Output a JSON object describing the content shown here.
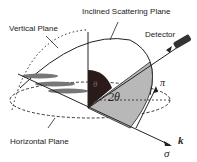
{
  "labels": {
    "inclined_plane": "Inclined Scattering Plane",
    "vertical_plane": "Vertical Plane",
    "detector": "Detector",
    "horizontal_plane": "Horizontal Plane"
  },
  "symbols": {
    "theta": "θ",
    "two_theta": "2θ",
    "pi": "π",
    "k": "k",
    "sigma": "σ"
  },
  "colors": {
    "line": "#222222",
    "dark_sector": "#2a1a1a",
    "grey_sector": "#b8b8b8",
    "sample": "#777777"
  }
}
